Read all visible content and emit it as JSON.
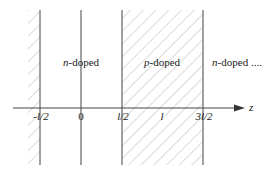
{
  "diagram": {
    "type": "doping-profile",
    "axis": {
      "label": "z",
      "ticks": [
        {
          "text": "-l/2",
          "x": 40
        },
        {
          "text": "0",
          "x": 81
        },
        {
          "text": "l/2",
          "x": 122
        },
        {
          "text": "l",
          "x": 162
        },
        {
          "text": "3l/2",
          "x": 203
        }
      ]
    },
    "regions": [
      {
        "label_italic": "n",
        "label_rest": "-doped",
        "x": 81
      },
      {
        "label_italic": "p",
        "label_rest": "-doped",
        "x": 162
      },
      {
        "label_italic": "n",
        "label_rest": "-doped ....",
        "x": 235
      }
    ],
    "colors": {
      "line": "#444444",
      "hatch": "#bdbdbd",
      "text": "#222222"
    }
  }
}
